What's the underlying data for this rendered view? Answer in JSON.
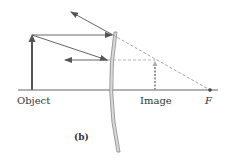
{
  "diagram": {
    "type": "convex-mirror-ray-diagram",
    "panel_label": "(b)",
    "labels": {
      "object": "Object",
      "image": "Image",
      "focal_point": "F"
    },
    "colors": {
      "ray": "#555555",
      "object_arrow": "#555555",
      "axis": "#666666",
      "dashed": "#999999",
      "mirror_fill": "#d9d9d9",
      "mirror_edge": "#888888",
      "text": "#333333"
    }
  }
}
